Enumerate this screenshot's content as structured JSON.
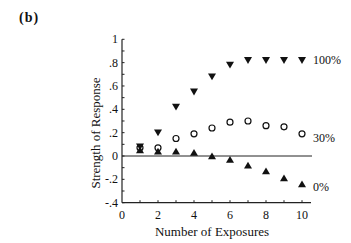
{
  "panel_label": "(b)",
  "chart_data": {
    "type": "scatter",
    "title": "",
    "xlabel": "Number of Exposures",
    "ylabel": "Strength of Response",
    "xlim": [
      0,
      10.5
    ],
    "ylim": [
      -0.4,
      1.0
    ],
    "x_ticks": [
      0,
      2,
      4,
      6,
      8,
      10
    ],
    "x_tick_labels": [
      "0",
      "2",
      "4",
      "6",
      "8",
      "10"
    ],
    "y_ticks": [
      -0.4,
      -0.2,
      0,
      0.2,
      0.4,
      0.6,
      0.8,
      1.0
    ],
    "y_tick_labels": [
      "-.4",
      "-.2",
      "0",
      ".2",
      ".4",
      ".6",
      ".8",
      "1"
    ],
    "grid": false,
    "zero_line": true,
    "legend_position": "inline-right",
    "x": [
      1,
      2,
      3,
      4,
      5,
      6,
      7,
      8,
      9,
      10
    ],
    "series": [
      {
        "name": "100%",
        "marker": "filled-down-triangle",
        "values": [
          0.08,
          0.2,
          0.42,
          0.55,
          0.68,
          0.78,
          0.82,
          0.82,
          0.82,
          0.82
        ]
      },
      {
        "name": "30%",
        "marker": "open-circle",
        "values": [
          0.07,
          0.07,
          0.15,
          0.19,
          0.24,
          0.29,
          0.3,
          0.26,
          0.25,
          0.19
        ]
      },
      {
        "name": "0%",
        "marker": "filled-up-triangle",
        "values": [
          0.05,
          0.04,
          0.04,
          0.03,
          0.0,
          -0.03,
          -0.08,
          -0.13,
          -0.19,
          -0.24
        ]
      }
    ]
  }
}
